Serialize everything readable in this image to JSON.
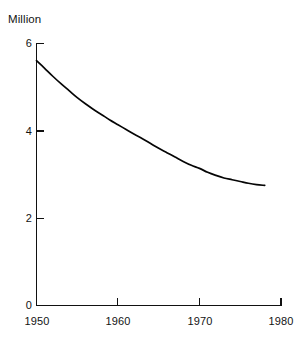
{
  "chart_data": {
    "type": "line",
    "title": "",
    "subtitle": "",
    "ylabel": "Million",
    "xlabel": "",
    "xlim": [
      1950,
      1980
    ],
    "ylim": [
      0,
      6
    ],
    "grid": false,
    "legend": null,
    "axis_color": "#111111",
    "line_color": "#050505",
    "background": "#ffffff",
    "y_ticks": [
      {
        "value": 6,
        "label": "6"
      },
      {
        "value": 4,
        "label": "4"
      },
      {
        "value": 2,
        "label": "2"
      },
      {
        "value": 0,
        "label": "0"
      }
    ],
    "x_ticks": [
      {
        "value": 1950,
        "label": "1950"
      },
      {
        "value": 1960,
        "label": "1960"
      },
      {
        "value": 1970,
        "label": "1970"
      },
      {
        "value": 1980,
        "label": "1980"
      }
    ],
    "series": [
      {
        "name": "Million",
        "x": [
          1950,
          1951,
          1952,
          1953,
          1954,
          1955,
          1956,
          1957,
          1958,
          1959,
          1960,
          1961,
          1962,
          1963,
          1964,
          1965,
          1966,
          1967,
          1968,
          1969,
          1970,
          1971,
          1972,
          1973,
          1974,
          1975,
          1976,
          1977,
          1978
        ],
        "values": [
          5.61,
          5.43,
          5.25,
          5.08,
          4.92,
          4.76,
          4.62,
          4.49,
          4.37,
          4.25,
          4.14,
          4.03,
          3.92,
          3.82,
          3.71,
          3.6,
          3.5,
          3.4,
          3.3,
          3.21,
          3.14,
          3.05,
          2.98,
          2.92,
          2.88,
          2.84,
          2.8,
          2.77,
          2.75
        ]
      }
    ],
    "notes": {
      "start_year": 1950,
      "start_value": 5.61,
      "end_year": 1978,
      "end_value": 2.75,
      "shape": "monotonic decreasing, convex, flattening after 1970"
    }
  }
}
